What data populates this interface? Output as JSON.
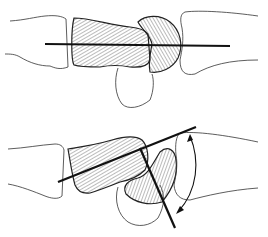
{
  "figure": {
    "type": "anatomical-diagram",
    "panels": [
      {
        "id": "top",
        "description": "aligned bones with single straight axis line"
      },
      {
        "id": "bottom",
        "description": "angled bones with two axis lines and curved double-headed angle arrow"
      }
    ],
    "colors": {
      "outline": "#333333",
      "axis": "#111111",
      "hatch": "#555555",
      "fill": "#d9d9d9",
      "background": "#ffffff"
    }
  }
}
